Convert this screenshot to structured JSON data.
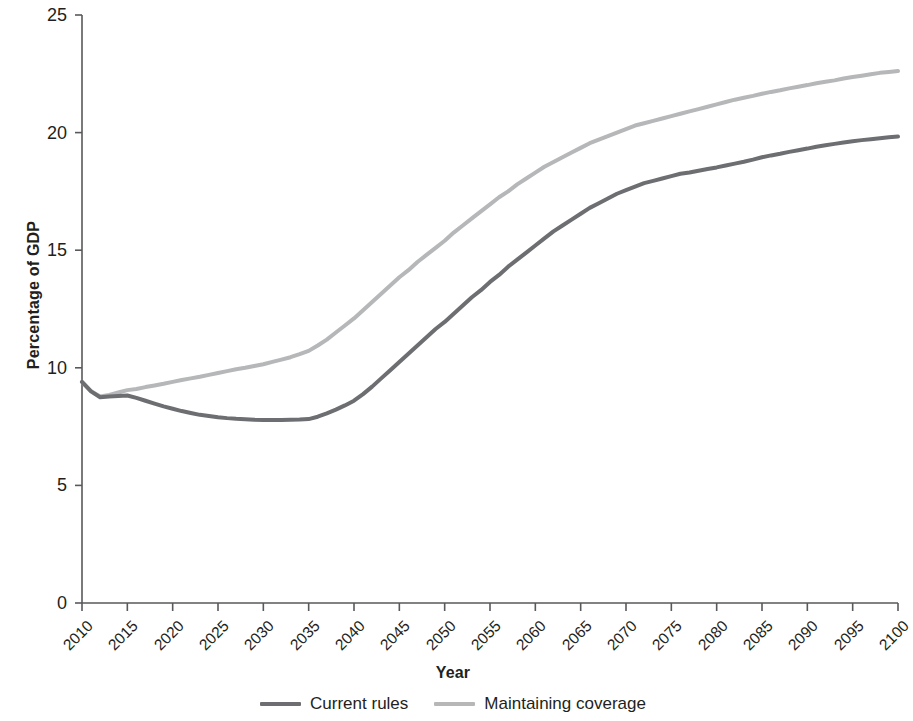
{
  "chart_data": {
    "type": "line",
    "title": "",
    "xlabel": "Year",
    "ylabel": "Percentage of GDP",
    "xlim": [
      2010,
      2100
    ],
    "ylim": [
      0,
      25
    ],
    "grid": false,
    "legend_position": "bottom-center",
    "xticks": [
      2010,
      2015,
      2020,
      2025,
      2030,
      2035,
      2040,
      2045,
      2050,
      2055,
      2060,
      2065,
      2070,
      2075,
      2080,
      2085,
      2090,
      2095,
      2100
    ],
    "xtick_labels": [
      "2010",
      "2015",
      "2020",
      "2025",
      "2030",
      "2035",
      "2040",
      "2045",
      "2050",
      "2055",
      "2060",
      "2065",
      "2070",
      "2075",
      "2080",
      "2085",
      "2090",
      "2095",
      "2100"
    ],
    "yticks": [
      0,
      5,
      10,
      15,
      20,
      25
    ],
    "ytick_labels": [
      "0",
      "5",
      "10",
      "15",
      "20",
      "25"
    ],
    "x": [
      2010,
      2011,
      2012,
      2013,
      2014,
      2015,
      2016,
      2017,
      2018,
      2019,
      2020,
      2021,
      2022,
      2023,
      2024,
      2025,
      2026,
      2027,
      2028,
      2029,
      2030,
      2031,
      2032,
      2033,
      2034,
      2035,
      2036,
      2037,
      2038,
      2039,
      2040,
      2041,
      2042,
      2043,
      2044,
      2045,
      2046,
      2047,
      2048,
      2049,
      2050,
      2051,
      2052,
      2053,
      2054,
      2055,
      2056,
      2057,
      2058,
      2059,
      2060,
      2061,
      2062,
      2063,
      2064,
      2065,
      2066,
      2067,
      2068,
      2069,
      2070,
      2071,
      2072,
      2073,
      2074,
      2075,
      2076,
      2077,
      2078,
      2079,
      2080,
      2081,
      2082,
      2083,
      2084,
      2085,
      2086,
      2087,
      2088,
      2089,
      2090,
      2091,
      2092,
      2093,
      2094,
      2095,
      2096,
      2097,
      2098,
      2099,
      2100
    ],
    "series": [
      {
        "name": "Current rules",
        "color": "#6d6e71",
        "values": [
          9.4,
          9.0,
          8.75,
          8.78,
          8.8,
          8.82,
          8.72,
          8.6,
          8.48,
          8.36,
          8.26,
          8.16,
          8.08,
          8.0,
          7.95,
          7.9,
          7.86,
          7.83,
          7.81,
          7.79,
          7.78,
          7.78,
          7.78,
          7.79,
          7.8,
          7.82,
          7.92,
          8.06,
          8.22,
          8.4,
          8.6,
          8.88,
          9.2,
          9.55,
          9.9,
          10.25,
          10.6,
          10.95,
          11.3,
          11.65,
          11.95,
          12.3,
          12.65,
          13.0,
          13.3,
          13.65,
          13.95,
          14.3,
          14.6,
          14.9,
          15.2,
          15.5,
          15.8,
          16.05,
          16.3,
          16.55,
          16.8,
          17.0,
          17.2,
          17.4,
          17.55,
          17.7,
          17.85,
          17.95,
          18.05,
          18.15,
          18.25,
          18.3,
          18.38,
          18.45,
          18.52,
          18.6,
          18.68,
          18.76,
          18.85,
          18.95,
          19.03,
          19.1,
          19.18,
          19.25,
          19.32,
          19.4,
          19.46,
          19.52,
          19.58,
          19.63,
          19.68,
          19.72,
          19.76,
          19.8,
          19.83
        ]
      },
      {
        "name": "Maintaining coverage",
        "color": "#b5b7b9",
        "values": [
          9.4,
          9.0,
          8.78,
          8.85,
          8.95,
          9.05,
          9.1,
          9.18,
          9.25,
          9.32,
          9.4,
          9.48,
          9.55,
          9.62,
          9.7,
          9.78,
          9.86,
          9.94,
          10.0,
          10.08,
          10.15,
          10.25,
          10.35,
          10.45,
          10.58,
          10.72,
          10.95,
          11.2,
          11.5,
          11.8,
          12.1,
          12.45,
          12.8,
          13.15,
          13.5,
          13.85,
          14.15,
          14.5,
          14.8,
          15.1,
          15.4,
          15.75,
          16.05,
          16.35,
          16.65,
          16.95,
          17.25,
          17.5,
          17.8,
          18.05,
          18.3,
          18.55,
          18.75,
          18.95,
          19.15,
          19.35,
          19.55,
          19.7,
          19.85,
          20.0,
          20.15,
          20.3,
          20.4,
          20.5,
          20.6,
          20.7,
          20.8,
          20.9,
          21.0,
          21.1,
          21.2,
          21.3,
          21.4,
          21.48,
          21.56,
          21.65,
          21.73,
          21.8,
          21.88,
          21.95,
          22.02,
          22.1,
          22.16,
          22.22,
          22.3,
          22.36,
          22.42,
          22.48,
          22.54,
          22.58,
          22.62
        ]
      }
    ]
  },
  "legend": {
    "items": [
      {
        "label": "Current rules",
        "color": "#6d6e71"
      },
      {
        "label": "Maintaining coverage",
        "color": "#b5b7b9"
      }
    ]
  },
  "axes": {
    "x_title": "Year",
    "y_title": "Percentage of GDP",
    "axis_color": "#58595b"
  }
}
